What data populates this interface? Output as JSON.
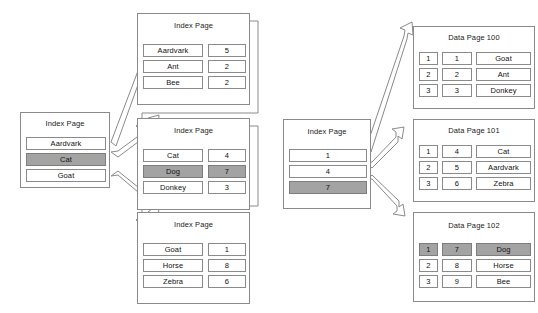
{
  "diagram": {
    "highlight_color": "#a3a3a3",
    "line_color": "#8a8a8a",
    "labels": {
      "index_page": "Index Page",
      "data_page_100": "Data Page 100",
      "data_page_101": "Data Page 101",
      "data_page_102": "Data Page 102"
    }
  },
  "root_index_page": {
    "title": "Index Page",
    "rows": [
      {
        "key": "Aardvark",
        "highlight": false
      },
      {
        "key": "Cat",
        "highlight": true
      },
      {
        "key": "Goat",
        "highlight": false
      }
    ]
  },
  "leaf_index_pages": [
    {
      "title": "Index Page",
      "rows": [
        {
          "key": "Aardvark",
          "value": "5",
          "highlight": false
        },
        {
          "key": "Ant",
          "value": "2",
          "highlight": false
        },
        {
          "key": "Bee",
          "value": "2",
          "highlight": false
        }
      ]
    },
    {
      "title": "Index Page",
      "rows": [
        {
          "key": "Cat",
          "value": "4",
          "highlight": false
        },
        {
          "key": "Dog",
          "value": "7",
          "highlight": true
        },
        {
          "key": "Donkey",
          "value": "3",
          "highlight": false
        }
      ]
    },
    {
      "title": "Index Page",
      "rows": [
        {
          "key": "Goat",
          "value": "1",
          "highlight": false
        },
        {
          "key": "Horse",
          "value": "8",
          "highlight": false
        },
        {
          "key": "Zebra",
          "value": "6",
          "highlight": false
        }
      ]
    }
  ],
  "middle_index_page": {
    "title": "Index Page",
    "rows": [
      {
        "key": "1",
        "highlight": false
      },
      {
        "key": "4",
        "highlight": false
      },
      {
        "key": "7",
        "highlight": true
      }
    ]
  },
  "data_pages": [
    {
      "title": "Data Page 100",
      "rows": [
        {
          "slot": "1",
          "key": "1",
          "value": "Goat",
          "highlight": false
        },
        {
          "slot": "2",
          "key": "2",
          "value": "Ant",
          "highlight": false
        },
        {
          "slot": "3",
          "key": "3",
          "value": "Donkey",
          "highlight": false
        }
      ]
    },
    {
      "title": "Data Page 101",
      "rows": [
        {
          "slot": "1",
          "key": "4",
          "value": "Cat",
          "highlight": false
        },
        {
          "slot": "2",
          "key": "5",
          "value": "Aardvark",
          "highlight": false
        },
        {
          "slot": "3",
          "key": "6",
          "value": "Zebra",
          "highlight": false
        }
      ]
    },
    {
      "title": "Data Page 102",
      "rows": [
        {
          "slot": "1",
          "key": "7",
          "value": "Dog",
          "highlight": true
        },
        {
          "slot": "2",
          "key": "8",
          "value": "Horse",
          "highlight": false
        },
        {
          "slot": "3",
          "key": "9",
          "value": "Bee",
          "highlight": false
        }
      ]
    }
  ]
}
